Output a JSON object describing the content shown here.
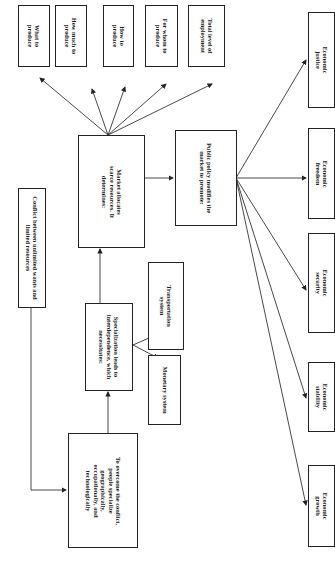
{
  "diagram": {
    "orientation": "rotated 90 degrees clockwise",
    "nodes": {
      "conflict": "Conflict between unlimited wants and limited resources",
      "overcome": "To overcome the conflict, people specialize geographically, occupationally, and technologically",
      "specialization": "Specialization leads to interdependence, which necessitates:",
      "monetary": "Monetary system",
      "transportation": "Transportation system",
      "market": "Market allocates scarce resources. It determines:",
      "what": "What to produce",
      "how_much": "How much to produce",
      "how": "How to produce",
      "for_whom": "For whom to produce",
      "employment": "Total level of employment",
      "policy": "Public policy modifies the market to promote:",
      "growth": "Economic growth",
      "stability": "Economic stability",
      "security": "Economic security",
      "freedom": "Economic freedom",
      "justice": "Economic justice"
    },
    "edges": [
      [
        "conflict",
        "overcome"
      ],
      [
        "overcome",
        "specialization"
      ],
      [
        "specialization",
        "monetary"
      ],
      [
        "specialization",
        "transportation"
      ],
      [
        "specialization",
        "market"
      ],
      [
        "market",
        "what"
      ],
      [
        "market",
        "how_much"
      ],
      [
        "market",
        "how"
      ],
      [
        "market",
        "for_whom"
      ],
      [
        "market",
        "employment"
      ],
      [
        "market",
        "policy"
      ],
      [
        "policy",
        "growth"
      ],
      [
        "policy",
        "stability"
      ],
      [
        "policy",
        "security"
      ],
      [
        "policy",
        "freedom"
      ],
      [
        "policy",
        "justice"
      ]
    ]
  }
}
